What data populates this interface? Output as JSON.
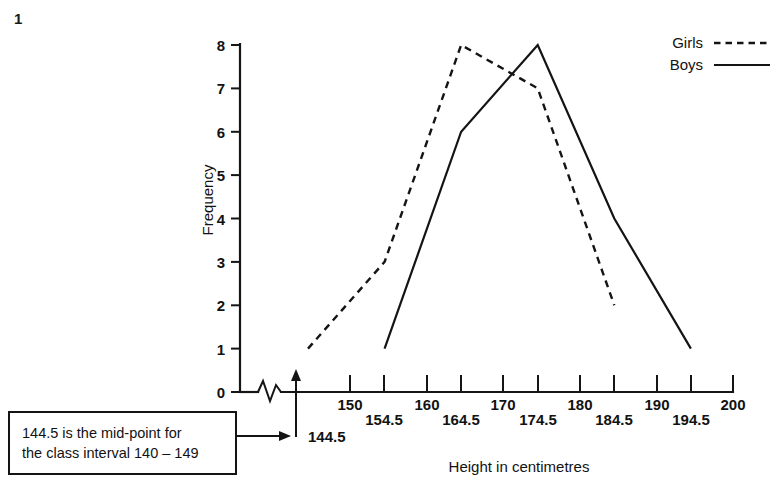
{
  "question_number": "1",
  "chart_data": {
    "type": "line",
    "title": "",
    "xlabel": "Height in centimetres",
    "ylabel": "Frequency",
    "xlim": [
      144.5,
      200
    ],
    "ylim": [
      0,
      8
    ],
    "grid": false,
    "legend_position": "top-right",
    "axis_break": true,
    "axis_break_note": "x-axis broken between 0 and 144.5",
    "x_tick_labels_row1": [
      "150",
      "160",
      "170",
      "180",
      "190",
      "200"
    ],
    "x_tick_labels_row2": [
      "154.5",
      "164.5",
      "174.5",
      "184.5",
      "194.5"
    ],
    "x_ticks": [
      150,
      154.5,
      160,
      164.5,
      170,
      174.5,
      180,
      184.5,
      190,
      194.5,
      200
    ],
    "y_ticks": [
      "0",
      "1",
      "2",
      "3",
      "4",
      "5",
      "6",
      "7",
      "8"
    ],
    "origin_label": "0",
    "series": [
      {
        "name": "Girls",
        "style": "dashed",
        "x": [
          144.5,
          154.5,
          164.5,
          174.5,
          184.5
        ],
        "values": [
          1,
          3,
          8,
          7,
          2
        ]
      },
      {
        "name": "Boys",
        "style": "solid",
        "x": [
          154.5,
          164.5,
          174.5,
          184.5,
          194.5
        ],
        "values": [
          1,
          6,
          8,
          4,
          1
        ]
      }
    ],
    "annotations": [
      {
        "target_label": "144.5",
        "text_line_1": "144.5 is the mid-point for",
        "text_line_2": "the class interval 140 – 149"
      }
    ]
  },
  "legend": {
    "items": [
      {
        "label": "Girls",
        "style": "dashed"
      },
      {
        "label": "Boys",
        "style": "solid"
      }
    ]
  },
  "callout": {
    "line_1": "144.5 is the mid-point for",
    "line_2": "the class interval 140 – 149",
    "target": "144.5"
  },
  "colors": {
    "ink": "#141414",
    "background": "#ffffff"
  }
}
